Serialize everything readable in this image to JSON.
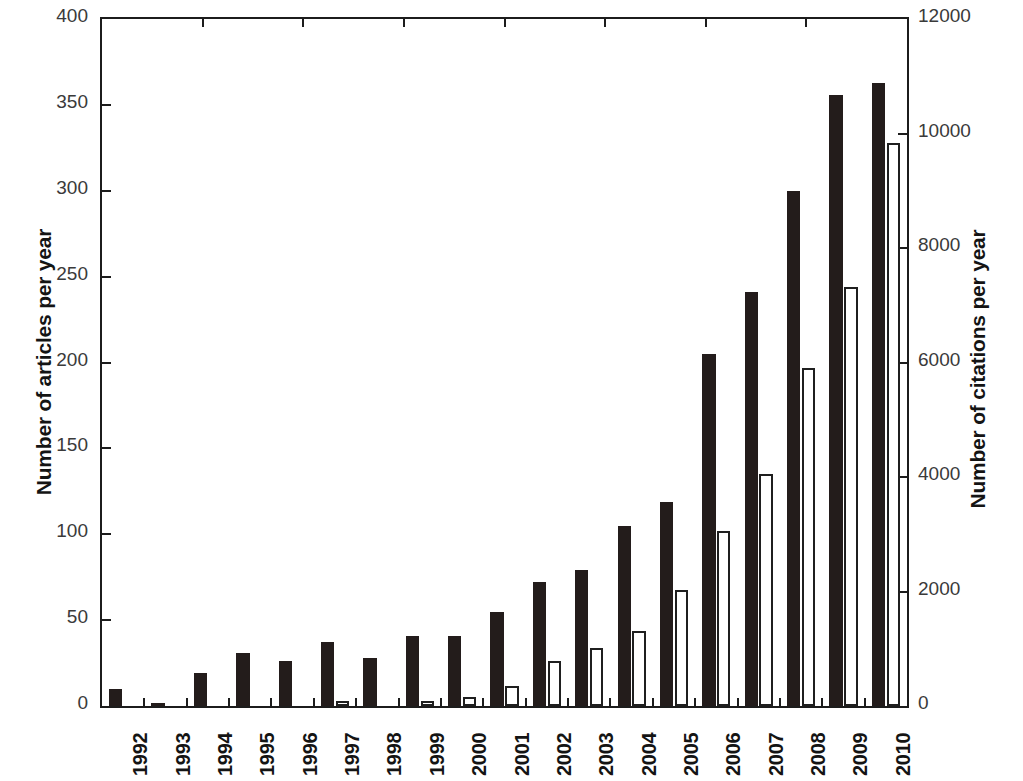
{
  "chart_data": {
    "type": "bar",
    "title": "",
    "subtitle": "",
    "xlabel": "",
    "ylabel": "Number of articles per year",
    "y2label": "Number of citations per year",
    "categories": [
      "1992",
      "1993",
      "1994",
      "1995",
      "1996",
      "1997",
      "1998",
      "1999",
      "2000",
      "2001",
      "2002",
      "2003",
      "2004",
      "2005",
      "2006",
      "2007",
      "2008",
      "2009",
      "2010"
    ],
    "series": [
      {
        "name": "Number of articles per year",
        "axis": "left",
        "color": "#231c1b",
        "style": "filled",
        "values": [
          10,
          2,
          19,
          31,
          26,
          37,
          28,
          41,
          41,
          55,
          72,
          79,
          105,
          119,
          205,
          241,
          300,
          356,
          363
        ]
      },
      {
        "name": "Number of citations per year",
        "axis": "right",
        "color": "#ffffff",
        "style": "outlined",
        "values": [
          0,
          0,
          0,
          0,
          0,
          30,
          20,
          90,
          160,
          350,
          780,
          1010,
          1310,
          2030,
          3050,
          4060,
          5910,
          7320,
          9840
        ]
      }
    ],
    "ylim": [
      0,
      400
    ],
    "yticks": [
      0,
      50,
      100,
      150,
      200,
      250,
      300,
      350,
      400
    ],
    "y2lim": [
      0,
      12000
    ],
    "y2ticks": [
      0,
      2000,
      4000,
      6000,
      8000,
      10000,
      12000
    ],
    "ytick_labels": [
      "0",
      "50",
      "100",
      "150",
      "200",
      "250",
      "300",
      "350",
      "400"
    ],
    "y2tick_labels": [
      "0",
      "2000",
      "4000",
      "6000",
      "8000",
      "10000",
      "12000"
    ],
    "grid": false,
    "legend": null,
    "legend_position": "none",
    "frame": "box",
    "xtick_rotation": -90
  }
}
